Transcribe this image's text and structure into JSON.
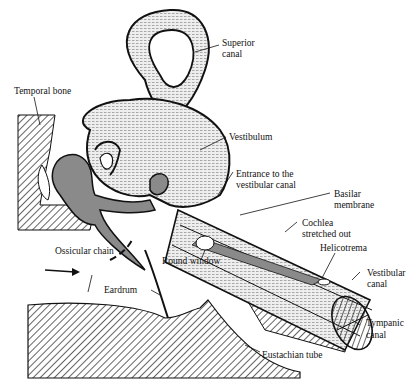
{
  "diagram": {
    "type": "anatomical-illustration",
    "labels": {
      "superior_canal": [
        "Superior",
        "canal"
      ],
      "temporal_bone": "Temporal bone",
      "vestibulum": "Vestibulum",
      "entrance": [
        "Entrance to the",
        "vestibular canal"
      ],
      "basilar": [
        "Basilar",
        "membrane"
      ],
      "cochlea": [
        "Cochlea",
        "stretched out"
      ],
      "ossicular_chain": "Ossicular chain",
      "round_window": "Round window",
      "helicotrema": "Helicotrema",
      "vestibular_canal": [
        "Vestibular",
        "canal"
      ],
      "eardrum": "Eardrum",
      "tympanic_canal": [
        "Tympanic",
        "canal"
      ],
      "eustachian_tube": "Eustachian tube"
    },
    "colors": {
      "ink": "#111111",
      "stipple_fill": "#d8d8d8",
      "ossicle_fill": "#8a8a8a",
      "hatch": "#222222"
    }
  }
}
